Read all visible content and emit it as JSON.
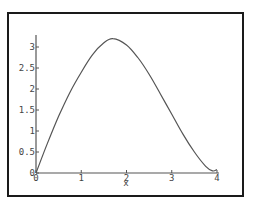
{
  "chart_data": {
    "type": "line",
    "title": "",
    "xlabel": "x",
    "ylabel": "",
    "xlim": [
      0,
      4
    ],
    "ylim": [
      0,
      3.3
    ],
    "grid": false,
    "legend": null,
    "x_ticks": [
      "0",
      "1",
      "2",
      "3",
      "4"
    ],
    "y_ticks": [
      "0",
      "0.5",
      "1",
      "1.5",
      "2",
      "2.5",
      "3"
    ],
    "series": [
      {
        "name": "f(x)",
        "x": [
          0,
          0.25,
          0.5,
          0.75,
          1,
          1.25,
          1.5,
          1.7,
          2,
          2.25,
          2.5,
          2.75,
          3,
          3.25,
          3.5,
          3.75,
          3.9,
          4
        ],
        "y": [
          0,
          0.7,
          1.35,
          1.92,
          2.4,
          2.82,
          3.1,
          3.2,
          3.05,
          2.75,
          2.35,
          1.88,
          1.4,
          0.92,
          0.5,
          0.16,
          0.05,
          0.08
        ]
      }
    ],
    "colors": {
      "line": "#555555",
      "axes": "#555555",
      "frame": "#1a1a1a"
    }
  }
}
